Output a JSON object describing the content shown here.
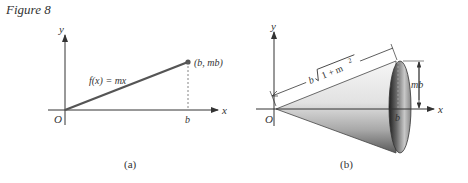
{
  "figure": {
    "title": "Figure 8"
  },
  "panel_a": {
    "caption": "(a)",
    "y_axis_label": "y",
    "x_axis_label": "x",
    "origin_label": "O",
    "b_tick_label": "b",
    "function_label": "f(x) = mx",
    "endpoint_label": "(b, mb)"
  },
  "panel_b": {
    "caption": "(b)",
    "y_axis_label": "y",
    "x_axis_label": "x",
    "origin_label": "O",
    "b_tick_label": "b",
    "slant_label_prefix": "b",
    "slant_label_radicand": "1 + m",
    "slant_label_exponent": "2",
    "radius_label": "mb"
  }
}
